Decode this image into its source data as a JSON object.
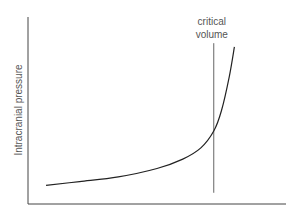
{
  "chart_data": {
    "type": "line",
    "title": "",
    "xlabel": "",
    "ylabel": "Intracranial pressure",
    "xlim": [
      0,
      1
    ],
    "ylim": [
      0,
      1
    ],
    "grid": false,
    "legend": "none",
    "series": [
      {
        "name": "pressure-volume curve",
        "x": [
          0.07,
          0.2,
          0.35,
          0.5,
          0.6,
          0.67,
          0.72,
          0.75,
          0.78,
          0.8
        ],
        "y": [
          0.1,
          0.12,
          0.145,
          0.19,
          0.24,
          0.3,
          0.39,
          0.5,
          0.68,
          0.84
        ]
      }
    ],
    "annotations": [
      {
        "type": "vline",
        "x": 0.72,
        "y_range": [
          0.06,
          0.86
        ],
        "label_lines": [
          "critical",
          "volume"
        ]
      }
    ],
    "colors": {
      "curve": "#222222",
      "axis": "#444444",
      "vline": "#666666",
      "text": "#555555"
    }
  }
}
